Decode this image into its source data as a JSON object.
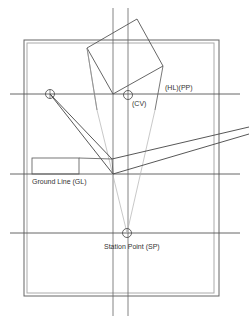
{
  "diagram": {
    "labels": {
      "hl_pp": "(HL)(PP)",
      "cv": "(CV)",
      "ground_line": "Ground Line (GL)",
      "station_point": "Station Point (SP)"
    },
    "colors": {
      "line": "#555555",
      "light_line": "#b0b0b0",
      "frame": "#666666",
      "frame_inner": "#aaaaaa"
    }
  }
}
